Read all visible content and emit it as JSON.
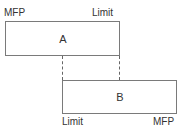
{
  "diagram": {
    "box_a": {
      "label": "A",
      "left_label": "MFP",
      "right_label": "Limit"
    },
    "box_b": {
      "label": "B",
      "left_label": "Limit",
      "right_label": "MFP"
    },
    "colors": {
      "border": "#7a7a7a",
      "dash": "#666666",
      "text": "#333333"
    }
  }
}
